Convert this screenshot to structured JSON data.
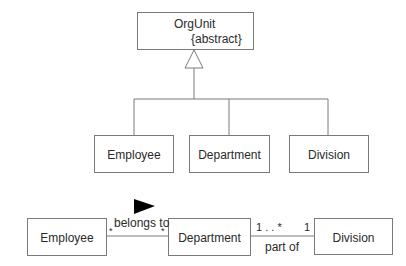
{
  "generalization": {
    "parent": {
      "name": "OrgUnit",
      "stereotype": "{abstract}"
    },
    "children": [
      {
        "name": "Employee"
      },
      {
        "name": "Department"
      },
      {
        "name": "Division"
      }
    ]
  },
  "associations": {
    "classes": [
      {
        "name": "Employee"
      },
      {
        "name": "Department"
      },
      {
        "name": "Division"
      }
    ],
    "links": [
      {
        "name": "belongs to",
        "from": "Employee",
        "to": "Department",
        "from_multiplicity": "*",
        "to_multiplicity": "*",
        "direction_arrow": "right"
      },
      {
        "name": "part of",
        "from": "Department",
        "to": "Division",
        "from_multiplicity": "1 . . *",
        "to_multiplicity": "1"
      }
    ]
  },
  "colors": {
    "line": "#7a7a7a",
    "text": "#2a2a2a",
    "arrow": "#000000"
  }
}
